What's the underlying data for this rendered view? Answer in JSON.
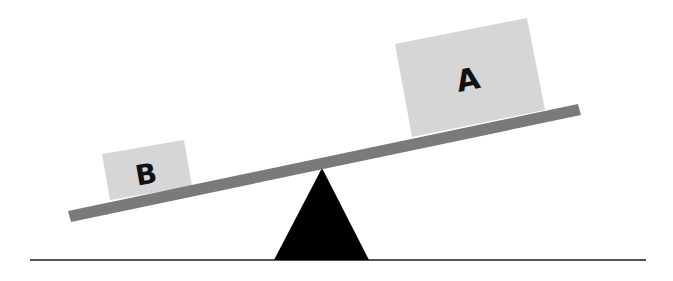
{
  "diagram": {
    "title": "",
    "boxes": [
      {
        "id": "A",
        "label": "A",
        "position": "right",
        "size": "large"
      },
      {
        "id": "B",
        "label": "B",
        "position": "left",
        "size": "small"
      }
    ],
    "colors": {
      "box_fill": "#d6d6d6",
      "plank": "#7a7a7a",
      "fulcrum": "#000000",
      "ground": "#555555"
    }
  }
}
